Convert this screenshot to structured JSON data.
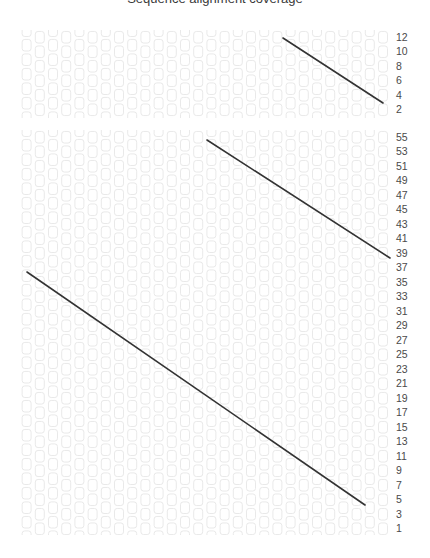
{
  "page": {
    "title_partial": "Sequence alignment coverage",
    "background_color": "#ffffff",
    "width": 430,
    "height": 558
  },
  "style": {
    "cell_stroke": "#e9e9e9",
    "cell_fill": "#ffffff",
    "line_color": "#333333",
    "label_color": "#4a4a4a"
  },
  "chart_data": {
    "type": "heatmap",
    "title": "Sequence alignment coverage",
    "xlabel": "",
    "ylabel": "",
    "grid": true,
    "legend": null,
    "panels": [
      {
        "name": "top-panel",
        "columns": 28,
        "rows": 6,
        "x_range": [
          20,
          390
        ],
        "y_range": [
          30,
          118
        ],
        "cell_pitch_x": 13.2,
        "cell_pitch_y": 14.5,
        "stagger": "alternate columns offset vertically by half a cell",
        "tick_labels": [
          "12",
          "10",
          "8",
          "6",
          "4",
          "2"
        ],
        "tick_values": [
          12,
          10,
          8,
          6,
          4,
          2
        ],
        "tick_step": -2,
        "lines": [
          {
            "name": "trend-line-1",
            "x1": 283,
            "y1": 38,
            "x2": 383,
            "y2": 103
          }
        ]
      },
      {
        "name": "bottom-panel",
        "columns": 28,
        "rows": 28,
        "x_range": [
          20,
          390
        ],
        "y_range": [
          130,
          535
        ],
        "cell_pitch_x": 13.2,
        "cell_pitch_y": 14.5,
        "stagger": "alternate columns offset vertically by half a cell",
        "tick_labels": [
          "55",
          "53",
          "51",
          "49",
          "47",
          "45",
          "43",
          "41",
          "39",
          "37",
          "35",
          "33",
          "31",
          "29",
          "27",
          "25",
          "23",
          "21",
          "19",
          "17",
          "15",
          "13",
          "11",
          "9",
          "7",
          "5",
          "3",
          "1"
        ],
        "tick_values": [
          55,
          53,
          51,
          49,
          47,
          45,
          43,
          41,
          39,
          37,
          35,
          33,
          31,
          29,
          27,
          25,
          23,
          21,
          19,
          17,
          15,
          13,
          11,
          9,
          7,
          5,
          3,
          1
        ],
        "tick_step": -2,
        "lines": [
          {
            "name": "trend-line-2",
            "x1": 207,
            "y1": 140,
            "x2": 390,
            "y2": 258
          },
          {
            "name": "trend-line-3",
            "x1": 27,
            "y1": 272,
            "x2": 365,
            "y2": 505
          }
        ]
      }
    ]
  }
}
